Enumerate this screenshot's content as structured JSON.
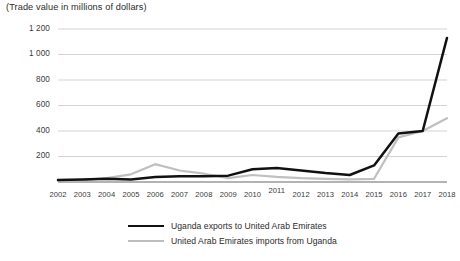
{
  "chart_data": {
    "type": "line",
    "title": "(Trade value in millions of dollars)",
    "xlabel": "",
    "ylabel": "",
    "ylim": [
      0,
      1200
    ],
    "ytick_labels": [
      "200",
      "400",
      "600",
      "800",
      "1 000",
      "1 200"
    ],
    "ytick_values": [
      200,
      400,
      600,
      800,
      1000,
      1200
    ],
    "grid": true,
    "legend_position": "bottom-center",
    "categories": [
      "2002",
      "2003",
      "2004",
      "2005",
      "2006",
      "2007",
      "2008",
      "2009",
      "2010",
      "2011",
      "2012",
      "2013",
      "2014",
      "2015",
      "2016",
      "2017",
      "2018"
    ],
    "series": [
      {
        "name": "Uganda exports to United Arab Emirates",
        "color": "#111111",
        "values": [
          15,
          20,
          25,
          20,
          40,
          45,
          45,
          50,
          100,
          110,
          90,
          70,
          55,
          130,
          380,
          400,
          1130
        ]
      },
      {
        "name": "United Arab Emirates imports from Uganda",
        "color": "#bfbfbf",
        "values": [
          10,
          15,
          30,
          60,
          140,
          90,
          65,
          30,
          55,
          40,
          30,
          25,
          20,
          25,
          350,
          400,
          500
        ]
      }
    ]
  },
  "colors": {
    "series_0": "#111111",
    "series_1": "#bfbfbf",
    "grid": "#c8c8c8",
    "axis": "#9a9a9a",
    "text": "#2b2b2b"
  }
}
